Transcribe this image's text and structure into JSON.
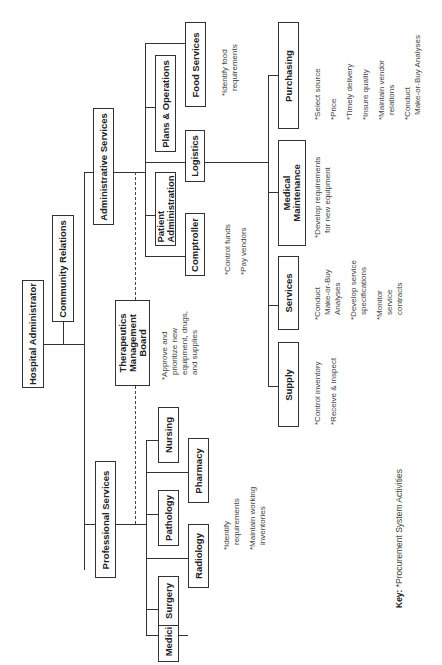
{
  "diagram": {
    "type": "organization-chart",
    "orientation": "rotated-90-ccw",
    "root": {
      "label": "Hospital Administrator",
      "staff": "Community Relations",
      "divisions": [
        {
          "label": "Administrative Services",
          "units": [
            {
              "label": "Patient Administration"
            },
            {
              "label": "Comptroller",
              "activities": [
                "*Control funds",
                "*Pay vendors"
              ]
            },
            {
              "label": "Plans & Operations"
            },
            {
              "label": "Logistics",
              "subunits": [
                {
                  "label": "Supply",
                  "activities": [
                    "*Control inventory",
                    "*Receive & inspect"
                  ]
                },
                {
                  "label": "Services",
                  "activities": [
                    "*Conduct|Make-or-Buy|Analyses",
                    "*Develop service|specifications",
                    "*Monitor|service|contracts"
                  ]
                },
                {
                  "label": "Medical Maintenance",
                  "activities": [
                    "*Develop requirements|for new equipment"
                  ]
                },
                {
                  "label": "Purchasing",
                  "activities": [
                    "*Select source",
                    "*Price",
                    "*Timely delivery",
                    "*Insure quality",
                    "*Maintain vendor|relations",
                    "*Conduct|Make-or-Buy Analyses"
                  ]
                }
              ]
            },
            {
              "label": "Food Services",
              "activities": [
                "*Identify food|requirements"
              ]
            }
          ]
        },
        {
          "label": "Therapeutics Management Board",
          "relationship": "dashed",
          "activities": [
            "*Approve and|prioritize new|equipment, drugs,|and supplies"
          ]
        },
        {
          "label": "Professional Services",
          "units": [
            {
              "label": "Medicine"
            },
            {
              "label": "Surgery"
            },
            {
              "label": "Radiology"
            },
            {
              "label": "Pathology"
            },
            {
              "label": "Pharmacy"
            },
            {
              "label": "Nursing"
            }
          ],
          "activities": [
            "*Identify|requirements",
            "*Maintain working|inventories"
          ]
        }
      ]
    }
  },
  "boxes": {
    "hospital_administrator": "Hospital Administrator",
    "community_relations": "Community Relations",
    "administrative_services": "Administrative Services",
    "professional_services": "Professional Services",
    "therapeutics_line1": "Therapeutics",
    "therapeutics_line2": "Management",
    "therapeutics_line3": "Board",
    "patient_admin_line1": "Patient",
    "patient_admin_line2": "Administration",
    "comptroller": "Comptroller",
    "plans_operations": "Plans & Operations",
    "logistics": "Logistics",
    "food_services": "Food Services",
    "supply": "Supply",
    "services": "Services",
    "medical_maint_line1": "Medical",
    "medical_maint_line2": "Maintenance",
    "purchasing": "Purchasing",
    "medicine": "Medicine",
    "surgery": "Surgery",
    "radiology": "Radiology",
    "pathology": "Pathology",
    "pharmacy": "Pharmacy",
    "nursing": "Nursing"
  },
  "notes": {
    "therapeutics": [
      "*Approve and",
      "prioritize new",
      "equipment, drugs,",
      "and supplies"
    ],
    "comptroller": [
      "*Control funds",
      "*Pay vendors"
    ],
    "food": [
      "*Identify food",
      "requirements"
    ],
    "supply": [
      "*Control inventory",
      "*Receive & inspect"
    ],
    "services": {
      "a1": "*Conduct",
      "a2": "Make-or-Buy",
      "a3": "Analyses",
      "b1": "*Develop service",
      "b2": "specifications",
      "c1": "*Monitor",
      "c2": "service",
      "c3": "contracts"
    },
    "medical": {
      "a1": "*Develop requirements",
      "a2": "for new equipment"
    },
    "purchasing": {
      "a": "*Select source",
      "b": "*Price",
      "c": "*Timely delivery",
      "d": "*Insure quality",
      "e1": "*Maintain vendor",
      "e2": "relations",
      "f1": "*Conduct",
      "f2": "Make-or-Buy Analyses"
    },
    "professional": {
      "a1": "*Identify",
      "a2": "requirements",
      "b1": "*Maintain working",
      "b2": "inventories"
    }
  },
  "key": {
    "label": "Key:",
    "text": "*Procurement System Activities"
  }
}
